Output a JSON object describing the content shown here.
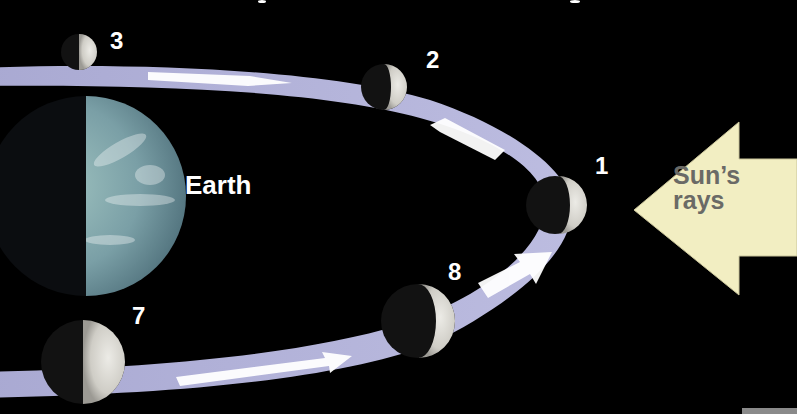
{
  "diagram": {
    "title_partial": "",
    "earth_label": "Earth",
    "sun_label_line1": "Sun’s",
    "sun_label_line2": "rays",
    "phase_labels": {
      "p1": "1",
      "p2": "2",
      "p3": "3",
      "p7": "7",
      "p8": "8"
    },
    "colors": {
      "background": "#000000",
      "orbit_band": "#b4b4d8",
      "orbit_arrows": "#ffffff",
      "sun_arrow": "#f2eec2",
      "sun_text": "#6a6a66",
      "earth_day": "#7fa6a8",
      "moon_lit": "#d8d6d0",
      "label_text": "#ffffff"
    }
  }
}
